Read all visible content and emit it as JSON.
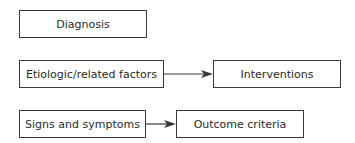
{
  "diagram": {
    "nodes": [
      {
        "id": "diagnosis",
        "label": "Diagnosis"
      },
      {
        "id": "etiologic",
        "label": "Etiologic/related factors"
      },
      {
        "id": "interventions",
        "label": "Interventions"
      },
      {
        "id": "signs",
        "label": "Signs and symptoms"
      },
      {
        "id": "outcome",
        "label": "Outcome criteria"
      }
    ],
    "edges": [
      {
        "from": "etiologic",
        "to": "interventions"
      },
      {
        "from": "signs",
        "to": "outcome"
      }
    ]
  }
}
